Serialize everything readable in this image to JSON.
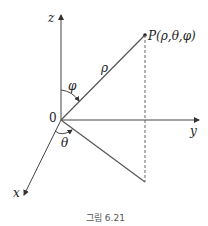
{
  "diagram": {
    "axes": {
      "z": "z",
      "y": "y",
      "x": "x",
      "origin": "0"
    },
    "point_label": "P(ρ,θ,φ)",
    "radius_label": "ρ",
    "polar_angle_label": "φ",
    "azimuth_label": "θ",
    "caption": "그림 6.21"
  }
}
